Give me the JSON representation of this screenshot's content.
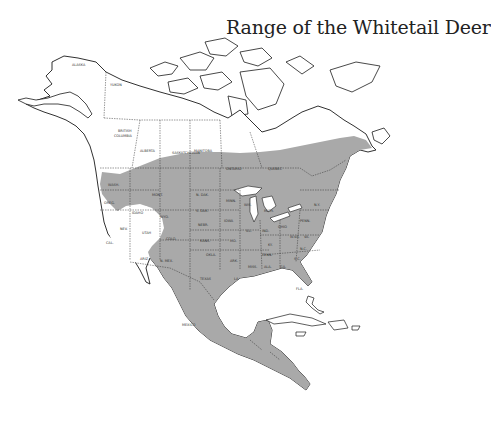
{
  "title": "Range of the Whitetail Deer",
  "colors": {
    "range_fill": "#a9a9a9",
    "land_fill": "#ffffff",
    "outline": "#1a1a1a",
    "background": "#ffffff"
  },
  "legend": {
    "shaded_meaning": "Whitetail deer range"
  },
  "labels": {
    "alaska": "ALASKA",
    "yukon": "YUKON",
    "british_columbia_1": "BRITISH",
    "british_columbia_2": "COLUMBIA",
    "alberta": "ALBERTA",
    "saskatchewan": "SASKATCHEWAN",
    "manitoba": "MANITOBA",
    "ontario": "ONTARIO",
    "quebec": "QUEBEC",
    "wash": "WASH.",
    "oreg": "OREG.",
    "idaho": "IDAHO",
    "mont": "MONT.",
    "wyo": "WYO.",
    "nev": "NEV.",
    "utah": "UTAH",
    "colo": "COLO.",
    "cal": "CAL.",
    "ariz": "ARIZ.",
    "nmex": "N. MEX.",
    "ndak": "N. DAK.",
    "sdak": "S. DAK.",
    "nebr": "NEBR.",
    "kans": "KANS.",
    "okla": "OKLA.",
    "texas": "TEXAS",
    "minn": "MINN.",
    "iowa": "IOWA",
    "mo": "MO.",
    "ark": "ARK.",
    "la": "LA.",
    "wis": "WIS.",
    "ill": "ILL.",
    "ind": "IND.",
    "ohio": "OHIO",
    "mich": "MICH.",
    "ky": "KY.",
    "tenn": "TENN.",
    "miss": "MISS.",
    "ala": "ALA.",
    "ga": "GA.",
    "fla": "FLA.",
    "sc": "S.C.",
    "nc": "N.C.",
    "va": "VA.",
    "wva": "W.VA.",
    "penn": "PENN.",
    "ny": "N.Y.",
    "mexico": "MEXICO"
  }
}
